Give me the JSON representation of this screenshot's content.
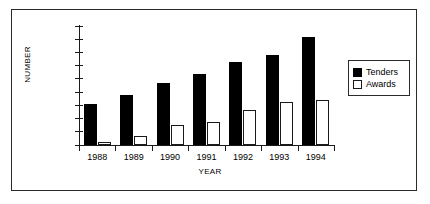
{
  "chart_data": {
    "type": "bar",
    "title": "",
    "xlabel": "YEAR",
    "ylabel": "NUMBER",
    "categories": [
      "1988",
      "1989",
      "1990",
      "1991",
      "1992",
      "1993",
      "1994"
    ],
    "series": [
      {
        "name": "Tenders",
        "color": "#000000",
        "values": [
          6200,
          7600,
          9400,
          10700,
          12500,
          13600,
          16300
        ]
      },
      {
        "name": "Awards",
        "color": "#ffffff",
        "values": [
          400,
          1400,
          3000,
          3500,
          5300,
          6500,
          6800
        ]
      }
    ],
    "ylim": [
      0,
      18000
    ],
    "yticks": [
      0,
      2000,
      4000,
      6000,
      8000,
      10000,
      12000,
      14000,
      16000,
      18000
    ],
    "ytick_labels": [
      "0",
      "2000",
      "4000",
      "6000",
      "8000",
      "10000",
      "12000",
      "14000",
      "16000",
      "18000"
    ],
    "grid": false,
    "legend_position": "right",
    "legend_entries": [
      "Tenders",
      "Awards"
    ]
  }
}
